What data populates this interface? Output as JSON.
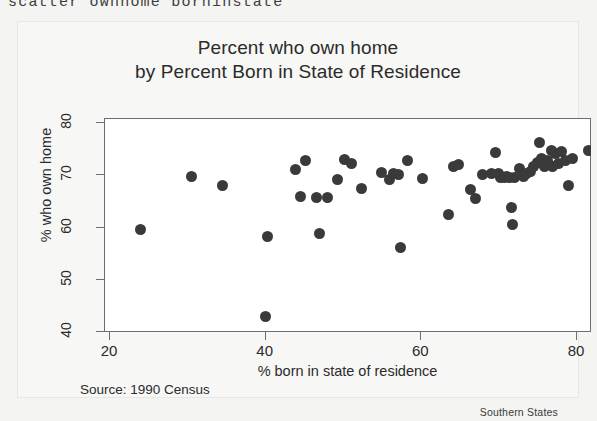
{
  "command_line": "scatter ownhome borninstate",
  "figure": {
    "title_line1": "Percent who own home",
    "title_line2": "by Percent Born in State of Residence",
    "source_note": "Source: 1990 Census",
    "corner_note": "Southern States",
    "marker_color": "#3a3a3a",
    "axis_color": "#6e6e6e",
    "plot_background": "#ffffff",
    "page_background": "#f4f4f2"
  },
  "chart_data": {
    "type": "scatter",
    "title": "Percent who own home by Percent Born in State of Residence",
    "xlabel": "% born in state of residence",
    "ylabel": "% who own home",
    "xlim": [
      18,
      83
    ],
    "ylim": [
      39,
      82
    ],
    "xticks": [
      20,
      40,
      60,
      80
    ],
    "yticks": [
      40,
      50,
      60,
      70,
      80
    ],
    "grid": false,
    "legend": null,
    "annotations": [
      "Source: 1990 Census",
      "Southern States"
    ],
    "series": [
      {
        "name": "Southern States",
        "marker": "circle",
        "color": "#3a3a3a",
        "points": [
          [
            24.0,
            59.4
          ],
          [
            30.6,
            69.6
          ],
          [
            34.6,
            67.8
          ],
          [
            40.1,
            42.8
          ],
          [
            40.3,
            58.1
          ],
          [
            44.0,
            71.0
          ],
          [
            44.6,
            65.7
          ],
          [
            45.3,
            72.7
          ],
          [
            46.6,
            65.6
          ],
          [
            47.0,
            58.7
          ],
          [
            48.1,
            65.5
          ],
          [
            49.4,
            68.9
          ],
          [
            50.2,
            72.9
          ],
          [
            51.1,
            72.0
          ],
          [
            52.5,
            67.3
          ],
          [
            55.0,
            70.4
          ],
          [
            56.0,
            69.0
          ],
          [
            56.6,
            70.2
          ],
          [
            57.2,
            70.0
          ],
          [
            57.4,
            56.0
          ],
          [
            58.4,
            72.6
          ],
          [
            60.3,
            69.1
          ],
          [
            63.6,
            62.3
          ],
          [
            64.3,
            71.5
          ],
          [
            64.9,
            71.9
          ],
          [
            66.4,
            67.0
          ],
          [
            67.1,
            65.4
          ],
          [
            68.0,
            70.0
          ],
          [
            69.2,
            70.2
          ],
          [
            69.6,
            74.2
          ],
          [
            70.0,
            70.2
          ],
          [
            70.3,
            69.4
          ],
          [
            70.8,
            69.3
          ],
          [
            71.1,
            69.5
          ],
          [
            71.5,
            69.4
          ],
          [
            71.7,
            63.7
          ],
          [
            71.9,
            60.3
          ],
          [
            72.1,
            69.4
          ],
          [
            72.8,
            71.1
          ],
          [
            73.2,
            69.6
          ],
          [
            73.6,
            70.2
          ],
          [
            74.1,
            70.6
          ],
          [
            74.6,
            71.4
          ],
          [
            75.0,
            72.3
          ],
          [
            75.3,
            76.0
          ],
          [
            75.6,
            73.0
          ],
          [
            76.0,
            71.4
          ],
          [
            76.3,
            72.7
          ],
          [
            76.8,
            74.6
          ],
          [
            77.0,
            71.5
          ],
          [
            77.4,
            73.9
          ],
          [
            77.8,
            72.1
          ],
          [
            78.2,
            74.3
          ],
          [
            78.6,
            72.6
          ],
          [
            79.0,
            67.8
          ],
          [
            79.6,
            73.0
          ],
          [
            81.6,
            74.6
          ]
        ]
      }
    ]
  }
}
